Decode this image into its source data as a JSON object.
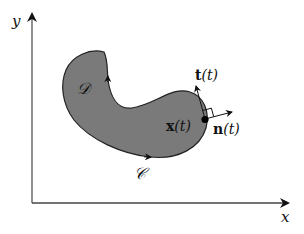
{
  "diagram": {
    "axes": {
      "x_label": "x",
      "y_label": "y"
    },
    "region": {
      "label": "𝒟",
      "fill": "#7a7a7a",
      "stroke": "#222222"
    },
    "curve": {
      "label": "𝒞"
    },
    "point": {
      "label_main": "x",
      "label_arg": "(t)"
    },
    "tangent": {
      "label_main": "t",
      "label_arg": "(t)"
    },
    "normal": {
      "label_main": "n",
      "label_arg": "(t)"
    }
  }
}
